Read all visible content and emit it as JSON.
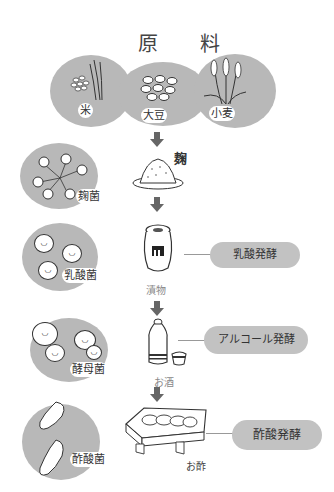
{
  "title": "原 料",
  "ingredients": [
    {
      "label": "米",
      "icon": "rice-plant-icon"
    },
    {
      "label": "大豆",
      "icon": "soybeans-icon"
    },
    {
      "label": "小麦",
      "icon": "wheat-icon"
    }
  ],
  "stages": [
    {
      "microbe": "麹菌",
      "product": "麹",
      "fermentation": null
    },
    {
      "microbe": "乳酸菌",
      "product": "漬物",
      "fermentation": "乳酸発酵"
    },
    {
      "microbe": "酵母菌",
      "product": "お酒",
      "fermentation": "アルコール発酵"
    },
    {
      "microbe": "酢酸菌",
      "product": "お酢",
      "fermentation": "酢酸発酵"
    }
  ],
  "colors": {
    "blob": "#b8b8b8",
    "cloud": "#c2c2c2",
    "arrow": "#666666",
    "ink": "#333333"
  }
}
